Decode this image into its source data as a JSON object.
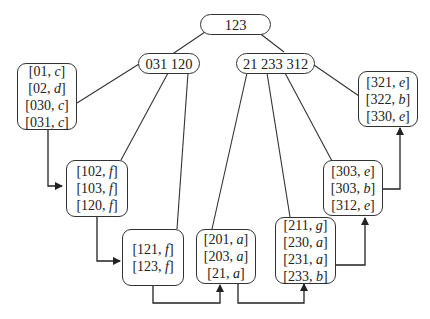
{
  "diagram": {
    "root": {
      "label": "123"
    },
    "inner_nodes": [
      {
        "id": "left",
        "label": "031 120"
      },
      {
        "id": "right",
        "label": "21 233 312"
      }
    ],
    "leaves": [
      {
        "id": "leaf1",
        "entries": [
          {
            "key": "01",
            "val": "c"
          },
          {
            "key": "02",
            "val": "d"
          },
          {
            "key": "030",
            "val": "c"
          },
          {
            "key": "031",
            "val": "c"
          }
        ]
      },
      {
        "id": "leaf2",
        "entries": [
          {
            "key": "102",
            "val": "f"
          },
          {
            "key": "103",
            "val": "f"
          },
          {
            "key": "120",
            "val": "f"
          }
        ]
      },
      {
        "id": "leaf3",
        "entries": [
          {
            "key": "121",
            "val": "f"
          },
          {
            "key": "123",
            "val": "f"
          }
        ]
      },
      {
        "id": "leaf4",
        "entries": [
          {
            "key": "201",
            "val": "a"
          },
          {
            "key": "203",
            "val": "a"
          },
          {
            "key": "21",
            "val": "a"
          }
        ]
      },
      {
        "id": "leaf5",
        "entries": [
          {
            "key": "211",
            "val": "g"
          },
          {
            "key": "230",
            "val": "a"
          },
          {
            "key": "231",
            "val": "a"
          },
          {
            "key": "233",
            "val": "b"
          }
        ]
      },
      {
        "id": "leaf6",
        "entries": [
          {
            "key": "303",
            "val": "e"
          },
          {
            "key": "303",
            "val": "b"
          },
          {
            "key": "312",
            "val": "e"
          }
        ]
      },
      {
        "id": "leaf7",
        "entries": [
          {
            "key": "321",
            "val": "e"
          },
          {
            "key": "322",
            "val": "b"
          },
          {
            "key": "330",
            "val": "e"
          }
        ]
      }
    ],
    "leaf_chain_order": [
      "leaf1",
      "leaf2",
      "leaf3",
      "leaf4",
      "leaf5",
      "leaf6",
      "leaf7"
    ],
    "colors": {
      "stroke": "#333333",
      "text": "#222222",
      "background": "#ffffff"
    }
  }
}
